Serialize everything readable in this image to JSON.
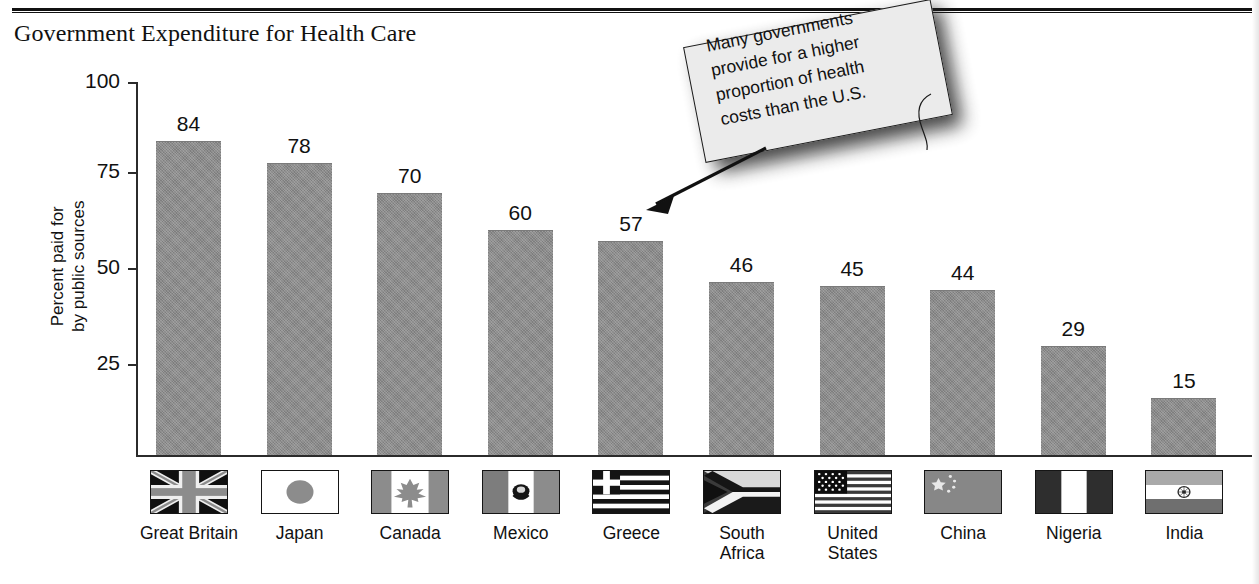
{
  "header": {
    "title": "Government Expenditure for Health Care",
    "rule": "horizontal-rule"
  },
  "callout": {
    "line1": "Many governments",
    "line2": "provide for a higher",
    "line3": "proportion of health",
    "line4": "costs than the U.S.",
    "full_text": "Many governments provide for a higher proportion of health costs than the U.S.",
    "arrow": "arrow-pointing-to-greece-bar"
  },
  "axis": {
    "y_title_line1": "Percent paid for",
    "y_title_line2": "by public sources",
    "ticks": [
      "100",
      "75",
      "50",
      "25"
    ]
  },
  "colors": {
    "bar_fill": "#8c8c8c",
    "axis": "#2b2b2b",
    "text": "#111111",
    "note_fill": "#ebebeb",
    "page_background": "#ffffff"
  },
  "chart_data": {
    "type": "bar",
    "title": "Government Expenditure for Health Care",
    "xlabel": "",
    "ylabel": "Percent paid for by public sources",
    "ylim": [
      0,
      100
    ],
    "yticks": [
      25,
      50,
      75,
      100
    ],
    "grid": false,
    "legend": "none",
    "categories": [
      "Great Britain",
      "Japan",
      "Canada",
      "Mexico",
      "Greece",
      "South Africa",
      "United States",
      "China",
      "Nigeria",
      "India"
    ],
    "values": [
      84,
      78,
      70,
      60,
      57,
      46,
      45,
      44,
      29,
      15
    ],
    "annotation": "Many governments provide for a higher proportion of health costs than the U.S."
  },
  "countries": [
    {
      "name": "Great Britain",
      "label_line1": "Great Britain",
      "label_line2": "",
      "value": "84",
      "flag": "flag-united-kingdom"
    },
    {
      "name": "Japan",
      "label_line1": "Japan",
      "label_line2": "",
      "value": "78",
      "flag": "flag-japan"
    },
    {
      "name": "Canada",
      "label_line1": "Canada",
      "label_line2": "",
      "value": "70",
      "flag": "flag-canada"
    },
    {
      "name": "Mexico",
      "label_line1": "Mexico",
      "label_line2": "",
      "value": "60",
      "flag": "flag-mexico"
    },
    {
      "name": "Greece",
      "label_line1": "Greece",
      "label_line2": "",
      "value": "57",
      "flag": "flag-greece"
    },
    {
      "name": "South Africa",
      "label_line1": "South",
      "label_line2": "Africa",
      "value": "46",
      "flag": "flag-south-africa"
    },
    {
      "name": "United States",
      "label_line1": "United",
      "label_line2": "States",
      "value": "45",
      "flag": "flag-united-states"
    },
    {
      "name": "China",
      "label_line1": "China",
      "label_line2": "",
      "value": "44",
      "flag": "flag-china"
    },
    {
      "name": "Nigeria",
      "label_line1": "Nigeria",
      "label_line2": "",
      "value": "29",
      "flag": "flag-nigeria"
    },
    {
      "name": "India",
      "label_line1": "India",
      "label_line2": "",
      "value": "15",
      "flag": "flag-india"
    }
  ]
}
